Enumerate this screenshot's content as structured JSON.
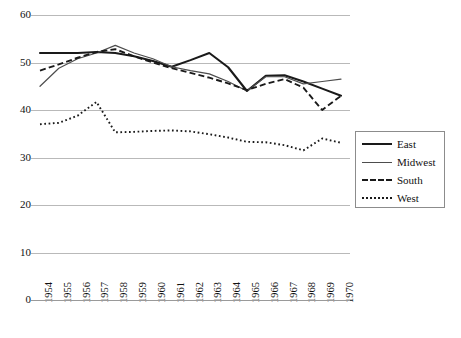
{
  "chart_data": {
    "type": "line",
    "title": "",
    "xlabel": "",
    "ylabel": "",
    "ylim": [
      0,
      60
    ],
    "ytick_values": [
      0,
      10,
      20,
      30,
      40,
      50,
      60
    ],
    "ytick_labels": [
      "0",
      "10",
      "20",
      "30",
      "40",
      "50",
      "60"
    ],
    "grid": "horizontal",
    "legend_position": "right",
    "categories": [
      "1954",
      "1955",
      "1956",
      "1957",
      "1958",
      "1959",
      "1960",
      "1961",
      "1962",
      "1963",
      "1964",
      "1965",
      "1966",
      "1967",
      "1968",
      "1969",
      "1970"
    ],
    "series": [
      {
        "name": "East",
        "style": "solid-thick",
        "color": "#1a1a1a",
        "values": [
          52.0,
          52.0,
          52.0,
          52.2,
          52.0,
          51.3,
          50.3,
          49.1,
          50.5,
          52.0,
          49.0,
          44.0,
          47.2,
          47.3,
          46.0,
          44.5,
          43.0
        ]
      },
      {
        "name": "Midwest",
        "style": "solid-thin",
        "color": "#4d4d4d",
        "values": [
          45.0,
          48.8,
          50.8,
          52.0,
          53.6,
          52.0,
          50.8,
          49.1,
          48.3,
          47.6,
          46.0,
          44.0,
          47.0,
          47.0,
          45.5,
          46.0,
          46.5
        ]
      },
      {
        "name": "South",
        "style": "dashed",
        "color": "#1a1a1a",
        "values": [
          48.3,
          49.6,
          51.0,
          52.2,
          52.8,
          51.3,
          50.0,
          48.8,
          47.8,
          46.8,
          45.6,
          44.2,
          45.5,
          46.5,
          44.7,
          40.0,
          43.0
        ]
      },
      {
        "name": "West",
        "style": "dotted",
        "color": "#1a1a1a",
        "values": [
          37.0,
          37.3,
          38.8,
          41.7,
          35.3,
          35.4,
          35.6,
          35.7,
          35.5,
          34.9,
          34.2,
          33.3,
          33.2,
          32.6,
          31.5,
          34.0,
          33.1
        ]
      }
    ]
  },
  "legend": {
    "items": [
      {
        "label": "East"
      },
      {
        "label": "Midwest"
      },
      {
        "label": "South"
      },
      {
        "label": "West"
      }
    ]
  }
}
